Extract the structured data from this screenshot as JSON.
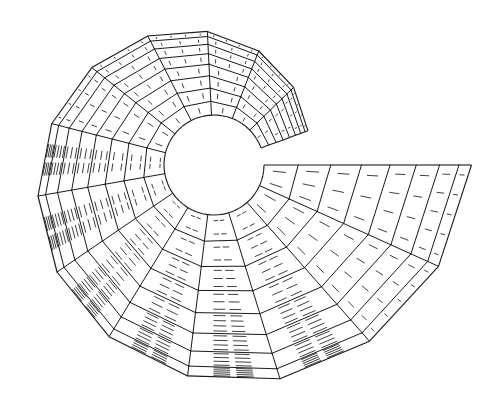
{
  "figure": {
    "mesh": {
      "start_angle_deg": 20,
      "end_angle_deg": 360,
      "sectors": 14,
      "rings": 8,
      "inner_radius_rel": 1.0,
      "outer_radius_rel_start": 2.0,
      "outer_radius_rel_end": 5.15,
      "end_edge": "straight horizontal"
    },
    "colors": {
      "line": "#1a1a1a",
      "background": "#ffffff"
    }
  }
}
